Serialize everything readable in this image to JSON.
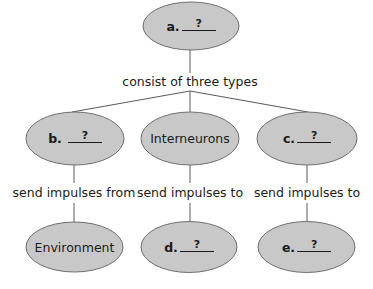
{
  "diagram": {
    "style": {
      "node_fill": "#c8c8c8",
      "node_stroke": "#6e6e6e",
      "line_color": "#5a5a5a",
      "text_color": "#1a1a1a"
    },
    "root": {
      "letter": "a.",
      "blank": "?"
    },
    "root_link_label": "consist of three types",
    "types": [
      {
        "id": "b",
        "letter": "b.",
        "blank": "?",
        "link_label": "send impulses from",
        "child": {
          "label": "Environment"
        }
      },
      {
        "id": "interneurons",
        "label": "Interneurons",
        "link_label": "send impulses to",
        "child": {
          "letter": "d.",
          "blank": "?"
        }
      },
      {
        "id": "c",
        "letter": "c.",
        "blank": "?",
        "link_label": "send impulses to",
        "child": {
          "letter": "e.",
          "blank": "?"
        }
      }
    ]
  }
}
